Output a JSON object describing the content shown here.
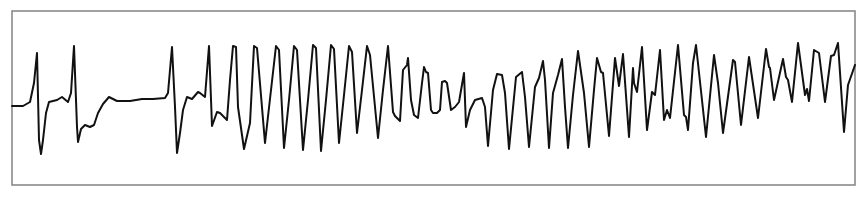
{
  "chart_data": {
    "type": "line",
    "title": "",
    "xlabel": "",
    "ylabel": "",
    "grid": false,
    "legend": null,
    "frame": {
      "x": 12,
      "y": 11,
      "width": 843,
      "height": 174,
      "color": "#8a8a8a"
    },
    "trace_color": "#111111",
    "coordinate_space": "pixel (867x200), y increases downward",
    "points": [
      [
        12,
        106
      ],
      [
        23,
        106
      ],
      [
        30,
        102
      ],
      [
        34,
        83
      ],
      [
        37,
        53
      ],
      [
        39,
        140
      ],
      [
        41,
        154
      ],
      [
        43,
        140
      ],
      [
        46,
        113
      ],
      [
        49,
        102
      ],
      [
        57,
        100
      ],
      [
        62,
        97
      ],
      [
        68,
        102
      ],
      [
        71,
        93
      ],
      [
        74,
        46
      ],
      [
        77,
        127
      ],
      [
        78,
        142
      ],
      [
        81,
        129
      ],
      [
        85,
        125
      ],
      [
        90,
        127
      ],
      [
        94,
        125
      ],
      [
        98,
        113
      ],
      [
        103,
        104
      ],
      [
        109,
        97
      ],
      [
        117,
        101
      ],
      [
        130,
        101
      ],
      [
        142,
        99
      ],
      [
        153,
        99
      ],
      [
        165,
        98
      ],
      [
        168,
        93
      ],
      [
        172,
        47
      ],
      [
        175,
        107
      ],
      [
        177,
        153
      ],
      [
        180,
        133
      ],
      [
        183,
        110
      ],
      [
        187,
        97
      ],
      [
        192,
        99
      ],
      [
        198,
        92
      ],
      [
        200,
        93
      ],
      [
        205,
        97
      ],
      [
        209,
        46
      ],
      [
        212,
        126
      ],
      [
        217,
        112
      ],
      [
        220,
        113
      ],
      [
        227,
        120
      ],
      [
        230,
        80
      ],
      [
        233,
        46
      ],
      [
        236,
        47
      ],
      [
        238,
        107
      ],
      [
        244,
        149
      ],
      [
        250,
        123
      ],
      [
        254,
        46
      ],
      [
        257,
        48
      ],
      [
        265,
        143
      ],
      [
        271,
        90
      ],
      [
        276,
        46
      ],
      [
        279,
        50
      ],
      [
        284,
        148
      ],
      [
        289,
        100
      ],
      [
        294,
        46
      ],
      [
        297,
        50
      ],
      [
        303,
        150
      ],
      [
        308,
        100
      ],
      [
        313,
        45
      ],
      [
        316,
        48
      ],
      [
        321,
        151
      ],
      [
        326,
        100
      ],
      [
        331,
        45
      ],
      [
        334,
        49
      ],
      [
        339,
        143
      ],
      [
        344,
        95
      ],
      [
        349,
        46
      ],
      [
        352,
        52
      ],
      [
        357,
        133
      ],
      [
        362,
        90
      ],
      [
        367,
        46
      ],
      [
        370,
        55
      ],
      [
        378,
        138
      ],
      [
        383,
        90
      ],
      [
        388,
        46
      ],
      [
        393,
        112
      ],
      [
        395,
        116
      ],
      [
        400,
        121
      ],
      [
        403,
        70
      ],
      [
        407,
        65
      ],
      [
        408,
        58
      ],
      [
        411,
        100
      ],
      [
        414,
        115
      ],
      [
        418,
        118
      ],
      [
        422,
        83
      ],
      [
        424,
        67
      ],
      [
        426,
        72
      ],
      [
        428,
        73
      ],
      [
        431,
        110
      ],
      [
        433,
        113
      ],
      [
        437,
        113
      ],
      [
        440,
        110
      ],
      [
        442,
        82
      ],
      [
        445,
        81
      ],
      [
        447,
        83
      ],
      [
        451,
        110
      ],
      [
        455,
        107
      ],
      [
        459,
        102
      ],
      [
        464,
        73
      ],
      [
        466,
        127
      ],
      [
        470,
        110
      ],
      [
        475,
        100
      ],
      [
        482,
        98
      ],
      [
        485,
        107
      ],
      [
        488,
        146
      ],
      [
        493,
        90
      ],
      [
        497,
        74
      ],
      [
        502,
        75
      ],
      [
        505,
        93
      ],
      [
        509,
        149
      ],
      [
        516,
        77
      ],
      [
        522,
        72
      ],
      [
        525,
        97
      ],
      [
        529,
        147
      ],
      [
        535,
        87
      ],
      [
        539,
        78
      ],
      [
        543,
        61
      ],
      [
        545,
        80
      ],
      [
        549,
        148
      ],
      [
        553,
        93
      ],
      [
        558,
        75
      ],
      [
        562,
        59
      ],
      [
        565,
        107
      ],
      [
        568,
        148
      ],
      [
        573,
        95
      ],
      [
        578,
        51
      ],
      [
        584,
        93
      ],
      [
        589,
        147
      ],
      [
        594,
        90
      ],
      [
        597,
        58
      ],
      [
        601,
        72
      ],
      [
        603,
        73
      ],
      [
        609,
        136
      ],
      [
        615,
        58
      ],
      [
        619,
        86
      ],
      [
        623,
        54
      ],
      [
        629,
        137
      ],
      [
        633,
        68
      ],
      [
        634,
        83
      ],
      [
        637,
        92
      ],
      [
        642,
        47
      ],
      [
        647,
        130
      ],
      [
        652,
        92
      ],
      [
        655,
        95
      ],
      [
        660,
        50
      ],
      [
        664,
        120
      ],
      [
        667,
        110
      ],
      [
        670,
        118
      ],
      [
        678,
        45
      ],
      [
        684,
        115
      ],
      [
        686,
        117
      ],
      [
        688,
        130
      ],
      [
        693,
        63
      ],
      [
        696,
        45
      ],
      [
        706,
        137
      ],
      [
        714,
        55
      ],
      [
        718,
        83
      ],
      [
        723,
        133
      ],
      [
        733,
        60
      ],
      [
        735,
        62
      ],
      [
        741,
        125
      ],
      [
        749,
        57
      ],
      [
        758,
        118
      ],
      [
        766,
        49
      ],
      [
        769,
        67
      ],
      [
        770,
        68
      ],
      [
        774,
        100
      ],
      [
        783,
        59
      ],
      [
        786,
        77
      ],
      [
        788,
        80
      ],
      [
        792,
        102
      ],
      [
        798,
        43
      ],
      [
        805,
        95
      ],
      [
        807,
        89
      ],
      [
        809,
        101
      ],
      [
        814,
        50
      ],
      [
        819,
        53
      ],
      [
        825,
        102
      ],
      [
        831,
        56
      ],
      [
        834,
        55
      ],
      [
        838,
        43
      ],
      [
        844,
        132
      ],
      [
        848,
        85
      ],
      [
        855,
        65
      ]
    ],
    "segments": [
      {
        "label": "complex-1",
        "x_range": [
          30,
          70
        ]
      },
      {
        "label": "complex-2",
        "x_range": [
          70,
          110
        ]
      },
      {
        "label": "pause",
        "x_range": [
          110,
          168
        ]
      },
      {
        "label": "complex-3",
        "x_range": [
          168,
          205
        ]
      },
      {
        "label": "complex-4",
        "x_range": [
          205,
          228
        ]
      },
      {
        "label": "tachycardia-run-sinusoidal",
        "x_range": [
          228,
          395
        ]
      },
      {
        "label": "tachycardia-run-polymorphic",
        "x_range": [
          395,
          855
        ]
      }
    ]
  }
}
